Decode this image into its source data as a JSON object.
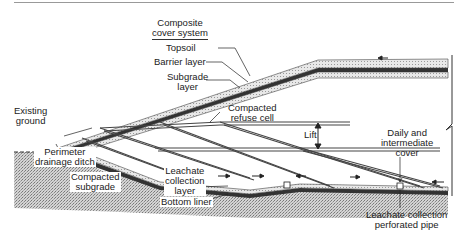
{
  "diagram": {
    "type": "landfill cross-section",
    "labels": {
      "composite_cover_line1": "Composite",
      "composite_cover_line2": "cover system",
      "topsoil": "Topsoil",
      "barrier_layer": "Barrier layer",
      "subgrade_line1": "Subgrade",
      "subgrade_line2": "layer",
      "existing_line1": "Existing",
      "existing_line2": "ground",
      "compacted_refuse_line1": "Compacted",
      "compacted_refuse_line2": "refuse cell",
      "lift": "Lift",
      "daily_line1": "Daily and",
      "daily_line2": "intermediate",
      "daily_line3": "cover",
      "perimeter_line1": "Perimeter",
      "perimeter_line2": "drainage ditch",
      "compacted_subgrade_line1": "Compacted",
      "compacted_subgrade_line2": "subgrade",
      "leachate_layer_line1": "Leachate",
      "leachate_layer_line2": "collection",
      "leachate_layer_line3": "layer",
      "bottom_liner": "Bottom liner",
      "leachate_pipe_line1": "Leachate collection",
      "leachate_pipe_line2": "perforated pipe"
    },
    "colors": {
      "ink": "#222222",
      "stipple": "#b8b8b8",
      "liner": "#333333"
    }
  }
}
